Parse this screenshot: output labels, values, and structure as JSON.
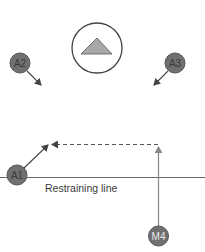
{
  "diagram": {
    "target": {
      "symbol": "triangle-in-circle",
      "icon": "triangle-icon"
    },
    "players": [
      {
        "id": "A2",
        "label": "A2"
      },
      {
        "id": "A3",
        "label": "A3"
      },
      {
        "id": "A1",
        "label": "A1"
      },
      {
        "id": "M4",
        "label": "M4"
      }
    ],
    "restraining_line": {
      "label": "Restraining line"
    },
    "movements": [
      {
        "from": "A2",
        "style": "solid",
        "direction": "down-right"
      },
      {
        "from": "A3",
        "style": "solid",
        "direction": "down-left"
      },
      {
        "from": "A1",
        "style": "solid",
        "direction": "up-right"
      },
      {
        "from": "M4",
        "style": "solid",
        "direction": "up"
      },
      {
        "from": "M4-path",
        "style": "dashed",
        "direction": "left",
        "note": "pass"
      }
    ],
    "colors": {
      "player_fill": "#707070",
      "player_stroke": "#555555",
      "line": "#555555",
      "triangle_fill": "#a8a8a8",
      "background": "#ffffff"
    }
  }
}
